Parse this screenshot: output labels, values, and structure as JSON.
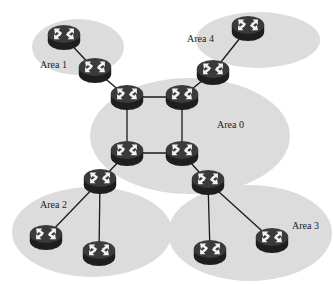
{
  "diagram": {
    "type": "ospf-area-topology",
    "colors": {
      "background": "#ffffff",
      "area_fill": "#dcdcdc",
      "router_body": "#2a2a2a",
      "router_top": "#3e3e3e",
      "router_arrows": "#f2f2f2",
      "link": "#1a1a1a",
      "label": "#222222"
    },
    "areas": [
      {
        "id": "area0",
        "label": "Area 0",
        "cx": 190,
        "cy": 136,
        "rx": 100,
        "ry": 58,
        "label_x": 217,
        "label_y": 128
      },
      {
        "id": "area1",
        "label": "Area 1",
        "cx": 78,
        "cy": 47,
        "rx": 46,
        "ry": 28,
        "label_x": 40,
        "label_y": 68
      },
      {
        "id": "area2",
        "label": "Area 2",
        "cx": 92,
        "cy": 232,
        "rx": 80,
        "ry": 45,
        "label_x": 40,
        "label_y": 208
      },
      {
        "id": "area3",
        "label": "Area 3",
        "cx": 250,
        "cy": 233,
        "rx": 82,
        "ry": 48,
        "label_x": 292,
        "label_y": 229
      },
      {
        "id": "area4",
        "label": "Area 4",
        "cx": 258,
        "cy": 40,
        "rx": 62,
        "ry": 28,
        "label_x": 187,
        "label_y": 42
      }
    ],
    "routers": [
      {
        "id": "r1a",
        "name": "Area 1 internal router",
        "x": 64,
        "y": 37
      },
      {
        "id": "r1b",
        "name": "Area 1 border router",
        "x": 95,
        "y": 70
      },
      {
        "id": "r4a",
        "name": "Area 4 internal router",
        "x": 248,
        "y": 28
      },
      {
        "id": "r4b",
        "name": "Area 4 border router",
        "x": 213,
        "y": 72
      },
      {
        "id": "r0a",
        "name": "Area 0 router top-left",
        "x": 127,
        "y": 97
      },
      {
        "id": "r0b",
        "name": "Area 0 router top-right",
        "x": 182,
        "y": 97
      },
      {
        "id": "r0c",
        "name": "Area 0 router bottom-left",
        "x": 127,
        "y": 153
      },
      {
        "id": "r0d",
        "name": "Area 0 router bottom-right",
        "x": 182,
        "y": 153
      },
      {
        "id": "r2a",
        "name": "Area 2 border router",
        "x": 100,
        "y": 181
      },
      {
        "id": "r2b",
        "name": "Area 2 router left",
        "x": 46,
        "y": 237
      },
      {
        "id": "r2c",
        "name": "Area 2 router bottom",
        "x": 99,
        "y": 253
      },
      {
        "id": "r3a",
        "name": "Area 3 border router",
        "x": 208,
        "y": 182
      },
      {
        "id": "r3b",
        "name": "Area 3 router bottom",
        "x": 210,
        "y": 252
      },
      {
        "id": "r3c",
        "name": "Area 3 router right",
        "x": 272,
        "y": 240
      }
    ],
    "links": [
      [
        "r1a",
        "r1b"
      ],
      [
        "r1b",
        "r0a"
      ],
      [
        "r4a",
        "r4b"
      ],
      [
        "r4b",
        "r0b"
      ],
      [
        "r0a",
        "r0b"
      ],
      [
        "r0a",
        "r0c"
      ],
      [
        "r0b",
        "r0d"
      ],
      [
        "r0c",
        "r0d"
      ],
      [
        "r0c",
        "r2a"
      ],
      [
        "r2a",
        "r2b"
      ],
      [
        "r2a",
        "r2c"
      ],
      [
        "r0d",
        "r3a"
      ],
      [
        "r3a",
        "r3b"
      ],
      [
        "r3a",
        "r3c"
      ]
    ]
  }
}
